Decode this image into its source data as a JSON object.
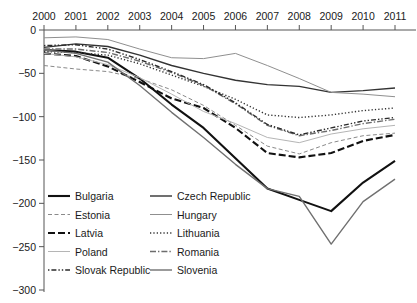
{
  "chart_data": {
    "type": "line",
    "title": "",
    "subtitle": "",
    "xlabel": "",
    "ylabel": "",
    "x": [
      2000,
      2001,
      2002,
      2003,
      2004,
      2005,
      2006,
      2007,
      2008,
      2009,
      2010,
      2011
    ],
    "xtick_labels": [
      "2000",
      "2001",
      "2002",
      "2003",
      "2004",
      "2005",
      "2006",
      "2007",
      "2008",
      "2009",
      "2010",
      "2011"
    ],
    "ytick_labels": [
      "0",
      "−50",
      "−100",
      "−150",
      "−200",
      "−250",
      "−300"
    ],
    "ytick_values": [
      0,
      -50,
      -100,
      -150,
      -200,
      -250,
      -300
    ],
    "xlim": [
      2000,
      2011
    ],
    "ylim": [
      -300,
      0
    ],
    "grid": false,
    "xaxis_position": "top",
    "legend_position": "bottom-inside",
    "legend_columns": 2,
    "series": [
      {
        "name": "Bulgaria",
        "style": "solid",
        "width": "thick",
        "color": "#111111",
        "values": [
          -23,
          -25,
          -32,
          -56,
          -86,
          -113,
          -148,
          -183,
          -196,
          -209,
          -176,
          -151
        ]
      },
      {
        "name": "Czech Republic",
        "style": "solid",
        "width": "medium",
        "color": "#333333",
        "values": [
          -20,
          -16,
          -19,
          -29,
          -41,
          -50,
          -58,
          -63,
          -65,
          -72,
          -70,
          -67
        ]
      },
      {
        "name": "Estonia",
        "style": "dashed",
        "width": "thin",
        "color": "#8a8a8a",
        "values": [
          -41,
          -45,
          -48,
          -56,
          -69,
          -87,
          -110,
          -134,
          -143,
          -130,
          -122,
          -119
        ]
      },
      {
        "name": "Hungary",
        "style": "solid",
        "width": "thin",
        "color": "#8f8f8f",
        "values": [
          -9,
          -8,
          -11,
          -22,
          -32,
          -33,
          -27,
          -41,
          -56,
          -72,
          -74,
          -77
        ]
      },
      {
        "name": "Latvia",
        "style": "long-dash",
        "width": "thick",
        "color": "#111111",
        "values": [
          -27,
          -30,
          -42,
          -60,
          -79,
          -90,
          -113,
          -142,
          -147,
          -142,
          -128,
          -121
        ]
      },
      {
        "name": "Lithuania",
        "style": "dotted",
        "width": "medium",
        "color": "#333333",
        "values": [
          -25,
          -26,
          -29,
          -39,
          -52,
          -65,
          -80,
          -98,
          -101,
          -98,
          -93,
          -90
        ]
      },
      {
        "name": "Poland",
        "style": "solid",
        "width": "thin",
        "color": "#b5b5b5",
        "values": [
          -27,
          -31,
          -40,
          -55,
          -74,
          -94,
          -108,
          -124,
          -130,
          -120,
          -114,
          -110
        ]
      },
      {
        "name": "Romania",
        "style": "dash-dot",
        "width": "medium",
        "color": "#6d6d6d",
        "values": [
          -22,
          -22,
          -26,
          -36,
          -49,
          -64,
          -85,
          -110,
          -122,
          -116,
          -108,
          -103
        ]
      },
      {
        "name": "Slovak Republic",
        "style": "dash-dot-dot",
        "width": "medium",
        "color": "#2b2b2b",
        "values": [
          -18,
          -17,
          -22,
          -34,
          -48,
          -63,
          -84,
          -109,
          -121,
          -113,
          -105,
          -101
        ]
      },
      {
        "name": "Slovenia",
        "style": "solid",
        "width": "medium",
        "color": "#707070",
        "values": [
          -23,
          -27,
          -37,
          -64,
          -95,
          -124,
          -155,
          -183,
          -192,
          -247,
          -198,
          -172
        ]
      }
    ],
    "legend_entries": [
      {
        "label": "Bulgaria",
        "column": 0,
        "row": 0
      },
      {
        "label": "Czech Republic",
        "column": 1,
        "row": 0
      },
      {
        "label": "Estonia",
        "column": 0,
        "row": 1
      },
      {
        "label": "Hungary",
        "column": 1,
        "row": 1
      },
      {
        "label": "Latvia",
        "column": 0,
        "row": 2
      },
      {
        "label": "Lithuania",
        "column": 1,
        "row": 2
      },
      {
        "label": "Poland",
        "column": 0,
        "row": 3
      },
      {
        "label": "Romania",
        "column": 1,
        "row": 3
      },
      {
        "label": "Slovak Republic",
        "column": 0,
        "row": 4
      },
      {
        "label": "Slovenia",
        "column": 1,
        "row": 4
      }
    ]
  }
}
